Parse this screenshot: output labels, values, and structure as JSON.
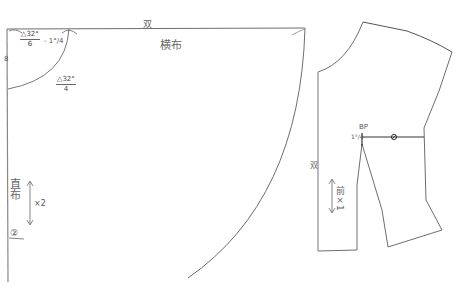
{
  "diagram": {
    "colors": {
      "line": "#6e6e6e",
      "line_dark": "#333333",
      "text": "#555555",
      "background": "#ffffff"
    },
    "skirt": {
      "fold_label": "双",
      "grain_label": "横布",
      "waist_front_formula": {
        "numerator": "△32°",
        "denominator": "6",
        "suffix": "- 1°/4"
      },
      "waist_arc_formula": {
        "numerator": "△32°",
        "denominator": "4"
      },
      "left_edge_mark": "8",
      "straight_grain_label": "直布",
      "cut_count": "×2",
      "piece_marker": "②"
    },
    "bodice": {
      "bust_point_label": "BP",
      "dart_offset_label": "1°/4",
      "fold_label": "双",
      "piece_label": "前×1",
      "bust_marker": "⊘"
    }
  }
}
